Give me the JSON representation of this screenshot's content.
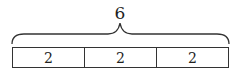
{
  "diagram": {
    "type": "tape-diagram",
    "total_label": "6",
    "segments": [
      {
        "label": "2"
      },
      {
        "label": "2"
      },
      {
        "label": "2"
      }
    ]
  }
}
